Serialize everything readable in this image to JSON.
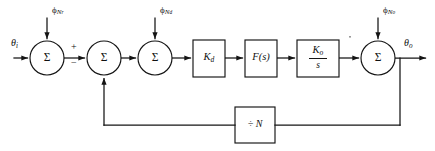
{
  "diagram": {
    "type": "control-block-diagram",
    "background_color": "#ffffff",
    "line_color": "#141414",
    "width": 435,
    "height": 151,
    "signals": {
      "input_label": "θ",
      "input_subscript": "i",
      "output_label": "θ",
      "output_subscript": "o"
    },
    "noise_inputs": [
      {
        "id": "phi-nr",
        "phi": "ϕ",
        "sub": "N",
        "sub2": "r",
        "x": 60,
        "y": 9
      },
      {
        "id": "phi-nd",
        "phi": "ϕ",
        "sub": "N",
        "sub2": "d",
        "x": 168,
        "y": 9
      },
      {
        "id": "phi-no",
        "phi": "ϕ",
        "sub": "N",
        "sub2": "o",
        "x": 375,
        "y": 9
      }
    ],
    "summing_junctions": [
      {
        "id": "sum-1",
        "symbol": "Σ",
        "cx": 47,
        "cy": 58,
        "r": 17
      },
      {
        "id": "sum-2",
        "symbol": "Σ",
        "cx": 104,
        "cy": 58,
        "r": 17
      },
      {
        "id": "sum-3",
        "symbol": "Σ",
        "cx": 155,
        "cy": 58,
        "r": 17
      },
      {
        "id": "sum-4",
        "symbol": "Σ",
        "cx": 378,
        "cy": 58,
        "r": 17
      }
    ],
    "signs": [
      {
        "id": "plus-sign",
        "text": "+",
        "x": 73,
        "y": 47
      },
      {
        "id": "minus-sign",
        "text": "−",
        "x": 73,
        "y": 62
      }
    ],
    "blocks": [
      {
        "id": "phase-detector",
        "label": "K",
        "sub": "d",
        "x": 193,
        "y": 40,
        "w": 32,
        "h": 37
      },
      {
        "id": "loop-filter",
        "label": "F(s)",
        "sub": "",
        "x": 245,
        "y": 40,
        "w": 32,
        "h": 37
      },
      {
        "id": "vco",
        "numerator": "K",
        "numerator_sub": "o",
        "denominator": "s",
        "x": 297,
        "y": 40,
        "w": 42,
        "h": 37
      },
      {
        "id": "divider",
        "label": "÷ N",
        "x": 235,
        "y": 107,
        "w": 40,
        "h": 36
      }
    ],
    "feedback": {
      "label": "÷ N",
      "description": "output fed back through divide-by-N to second summing junction"
    }
  }
}
